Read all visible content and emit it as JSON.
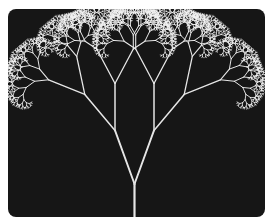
{
  "image": {
    "subject": "Symmetric fractal binary tree, white branches on black background",
    "colors": {
      "page_background": "#ffffff",
      "panel_background": "#161616",
      "branch": "#e6e6e6",
      "twig": "#f2f2f2"
    },
    "tree": {
      "branching": "binary",
      "symmetry": "bilateral",
      "recursion_levels": 11
    }
  }
}
